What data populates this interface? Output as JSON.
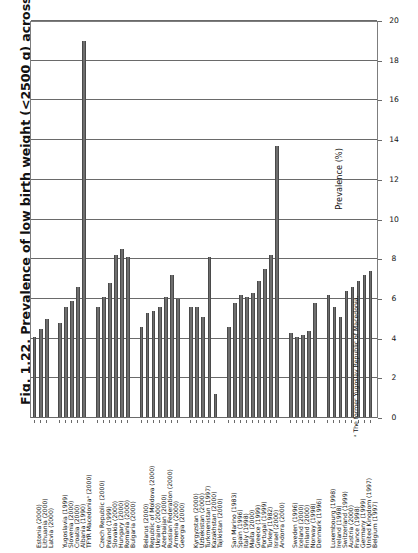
{
  "figure": {
    "title": "Fig. 1.22. Prevalence of low birth weight (<2500 g) across the European Region",
    "footnote": "ᵃ The former Yugoslav Republic of Macedonia."
  },
  "axis": {
    "value_axis_title": "Prevalence (%)",
    "ticks": [
      "0",
      "2",
      "4",
      "6",
      "8",
      "10",
      "12",
      "14",
      "16",
      "18",
      "20"
    ]
  },
  "chart_data": {
    "type": "bar",
    "title": "Fig. 1.22. Prevalence of low birth weight (<2500 g) across the European Region",
    "xlabel": "",
    "ylabel": "Prevalence (%)",
    "ylim": [
      0,
      20
    ],
    "grid": true,
    "orientation": "vertical-bars-rotated-page",
    "legend": "none",
    "bar_color": "#6e6e6e",
    "categories": [
      "Estonia (2000)",
      "Lithuania (2000)",
      "Latvia (2000)",
      "Yugoslavia (1999)",
      "Slovenia (2000)",
      "Croatia (2000)",
      "Albania (1990)",
      "TFYR Macedoniaᵃ (2000)",
      "Czech Republic (2000)",
      "Poland (1999)",
      "Slovakia (2000)",
      "Hungary (2000)",
      "Romania (2000)",
      "Bulgaria (2000)",
      "Belarus (2000)",
      "Republic of Moldova (2000)",
      "Ukraine (2000)",
      "Azerbaijan (2000)",
      "Russian Federation (2000)",
      "Armenia (2000)",
      "Georgia (2000)",
      "Kyrgyzstan (2000)",
      "Uzbekistan (2000)",
      "Turkmenistan (1997)",
      "Kazakhstan (2000)",
      "Tajikistan (2000)",
      "San Marino (1983)",
      "Spain (1996)",
      "Italy (1998)",
      "Malta (2000)",
      "Greece (1999)",
      "Portugal (1999)",
      "Turkey (1982)",
      "Israel (2000)",
      "Andorra (2000)",
      "Sweden (1996)",
      "Iceland (2000)",
      "Finland (2000)",
      "Norway (1998)",
      "Denmark (1996)",
      "Luxembourg (1998)",
      "Ireland (1998)",
      "Switzerland (1999)",
      "Austria (2000)",
      "France (1998)",
      "Germany (1999)",
      "United Kingdom (1997)",
      "Belgium (1997)"
    ],
    "values": [
      4.1,
      4.5,
      5.0,
      4.8,
      5.6,
      5.9,
      6.6,
      19.0,
      5.6,
      6.1,
      6.8,
      8.2,
      8.5,
      8.1,
      4.6,
      5.3,
      5.4,
      5.6,
      6.1,
      7.2,
      6.0,
      5.6,
      5.6,
      5.1,
      8.1,
      1.2,
      4.6,
      5.8,
      6.2,
      6.1,
      6.3,
      6.9,
      7.5,
      8.2,
      13.7,
      4.3,
      4.1,
      4.2,
      4.4,
      5.8,
      6.2,
      5.6,
      5.1,
      6.4,
      6.6,
      6.9,
      7.2,
      7.4
    ],
    "group_breaks_after": [
      2,
      7,
      13,
      20,
      25,
      34,
      39
    ]
  }
}
